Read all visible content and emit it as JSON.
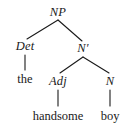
{
  "figure": {
    "type": "syntax-tree",
    "background_color": "#ffffff",
    "line_color": "#1a1a1a"
  },
  "nodes": {
    "np": {
      "label": "NP",
      "kind": "category",
      "style": "italic",
      "x": 58,
      "y": 12
    },
    "det": {
      "label": "Det",
      "kind": "category",
      "style": "italic",
      "x": 25,
      "y": 46
    },
    "nbar": {
      "label": "N′",
      "kind": "category",
      "style": "italic",
      "x": 83,
      "y": 48
    },
    "the": {
      "label": "the",
      "kind": "terminal",
      "style": "roman",
      "x": 25,
      "y": 79
    },
    "adj": {
      "label": "Adj",
      "kind": "category",
      "style": "italic",
      "x": 58,
      "y": 81
    },
    "n": {
      "label": "N",
      "kind": "category",
      "style": "italic",
      "x": 110,
      "y": 81
    },
    "handsome": {
      "label": "handsome",
      "kind": "terminal",
      "style": "roman",
      "x": 58,
      "y": 116
    },
    "boy": {
      "label": "boy",
      "kind": "terminal",
      "style": "roman",
      "x": 110,
      "y": 116
    }
  },
  "edges": [
    {
      "from": "np",
      "to": "det",
      "x1": 58,
      "y1": 20,
      "x2": 27,
      "y2": 39
    },
    {
      "from": "np",
      "to": "nbar",
      "x1": 58,
      "y1": 20,
      "x2": 82,
      "y2": 41
    },
    {
      "from": "det",
      "to": "the",
      "x1": 25,
      "y1": 55,
      "x2": 25,
      "y2": 70
    },
    {
      "from": "nbar",
      "to": "adj",
      "x1": 83,
      "y1": 57,
      "x2": 60,
      "y2": 73
    },
    {
      "from": "nbar",
      "to": "n",
      "x1": 83,
      "y1": 57,
      "x2": 109,
      "y2": 73
    },
    {
      "from": "adj",
      "to": "handsome",
      "x1": 58,
      "y1": 90,
      "x2": 58,
      "y2": 106
    },
    {
      "from": "n",
      "to": "boy",
      "x1": 110,
      "y1": 90,
      "x2": 110,
      "y2": 106
    }
  ]
}
